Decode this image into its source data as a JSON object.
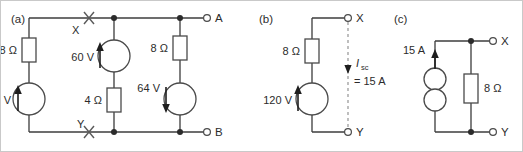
{
  "figure": {
    "background_color": "#ffffff",
    "border_color": "#c9c9c9",
    "wire_color": "#3c3c3c",
    "dashed_color": "#8a8a8a"
  },
  "panels": [
    {
      "id": "a",
      "label": "(a)",
      "node_labels": {
        "top": "X",
        "bottom": "Y"
      },
      "terminals": {
        "top": "A",
        "bottom": "B"
      },
      "components": [
        {
          "name": "resistor-8ohm-left",
          "type": "resistor",
          "value": "8 Ω"
        },
        {
          "name": "source-120v",
          "type": "voltage-source",
          "value": "120 V",
          "arrow": "up"
        },
        {
          "name": "source-60v",
          "type": "voltage-source",
          "value": "60 V",
          "arrow": "up"
        },
        {
          "name": "resistor-4ohm",
          "type": "resistor",
          "value": "4 Ω"
        },
        {
          "name": "resistor-8ohm-right",
          "type": "resistor",
          "value": "8 Ω"
        },
        {
          "name": "source-64v",
          "type": "voltage-source",
          "value": "64 V",
          "arrow": "down"
        }
      ]
    },
    {
      "id": "b",
      "label": "(b)",
      "terminals": {
        "top": "X",
        "bottom": "Y"
      },
      "components": [
        {
          "name": "resistor-8ohm",
          "type": "resistor",
          "value": "8 Ω"
        },
        {
          "name": "source-120v",
          "type": "voltage-source",
          "value": "120 V",
          "arrow": "up"
        }
      ],
      "current_annotation": {
        "symbol": "I",
        "subscript": "sc",
        "equals": "= 15 A",
        "arrow": "down"
      }
    },
    {
      "id": "c",
      "label": "(c)",
      "terminals": {
        "top": "X",
        "bottom": "Y"
      },
      "components": [
        {
          "name": "source-15a",
          "type": "current-source",
          "value": "15 A",
          "arrow": "up"
        },
        {
          "name": "resistor-8ohm",
          "type": "resistor",
          "value": "8 Ω"
        }
      ]
    }
  ]
}
